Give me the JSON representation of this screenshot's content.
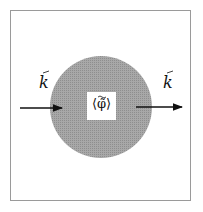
{
  "diagram": {
    "incoming_label": "k",
    "outgoing_label": "k",
    "center_label": "⟨φ̃⟩",
    "colors": {
      "frame": "#9a9a9a",
      "region": "#9c9c9c",
      "arrow": "#111111",
      "center_box": "#ffffff"
    }
  }
}
